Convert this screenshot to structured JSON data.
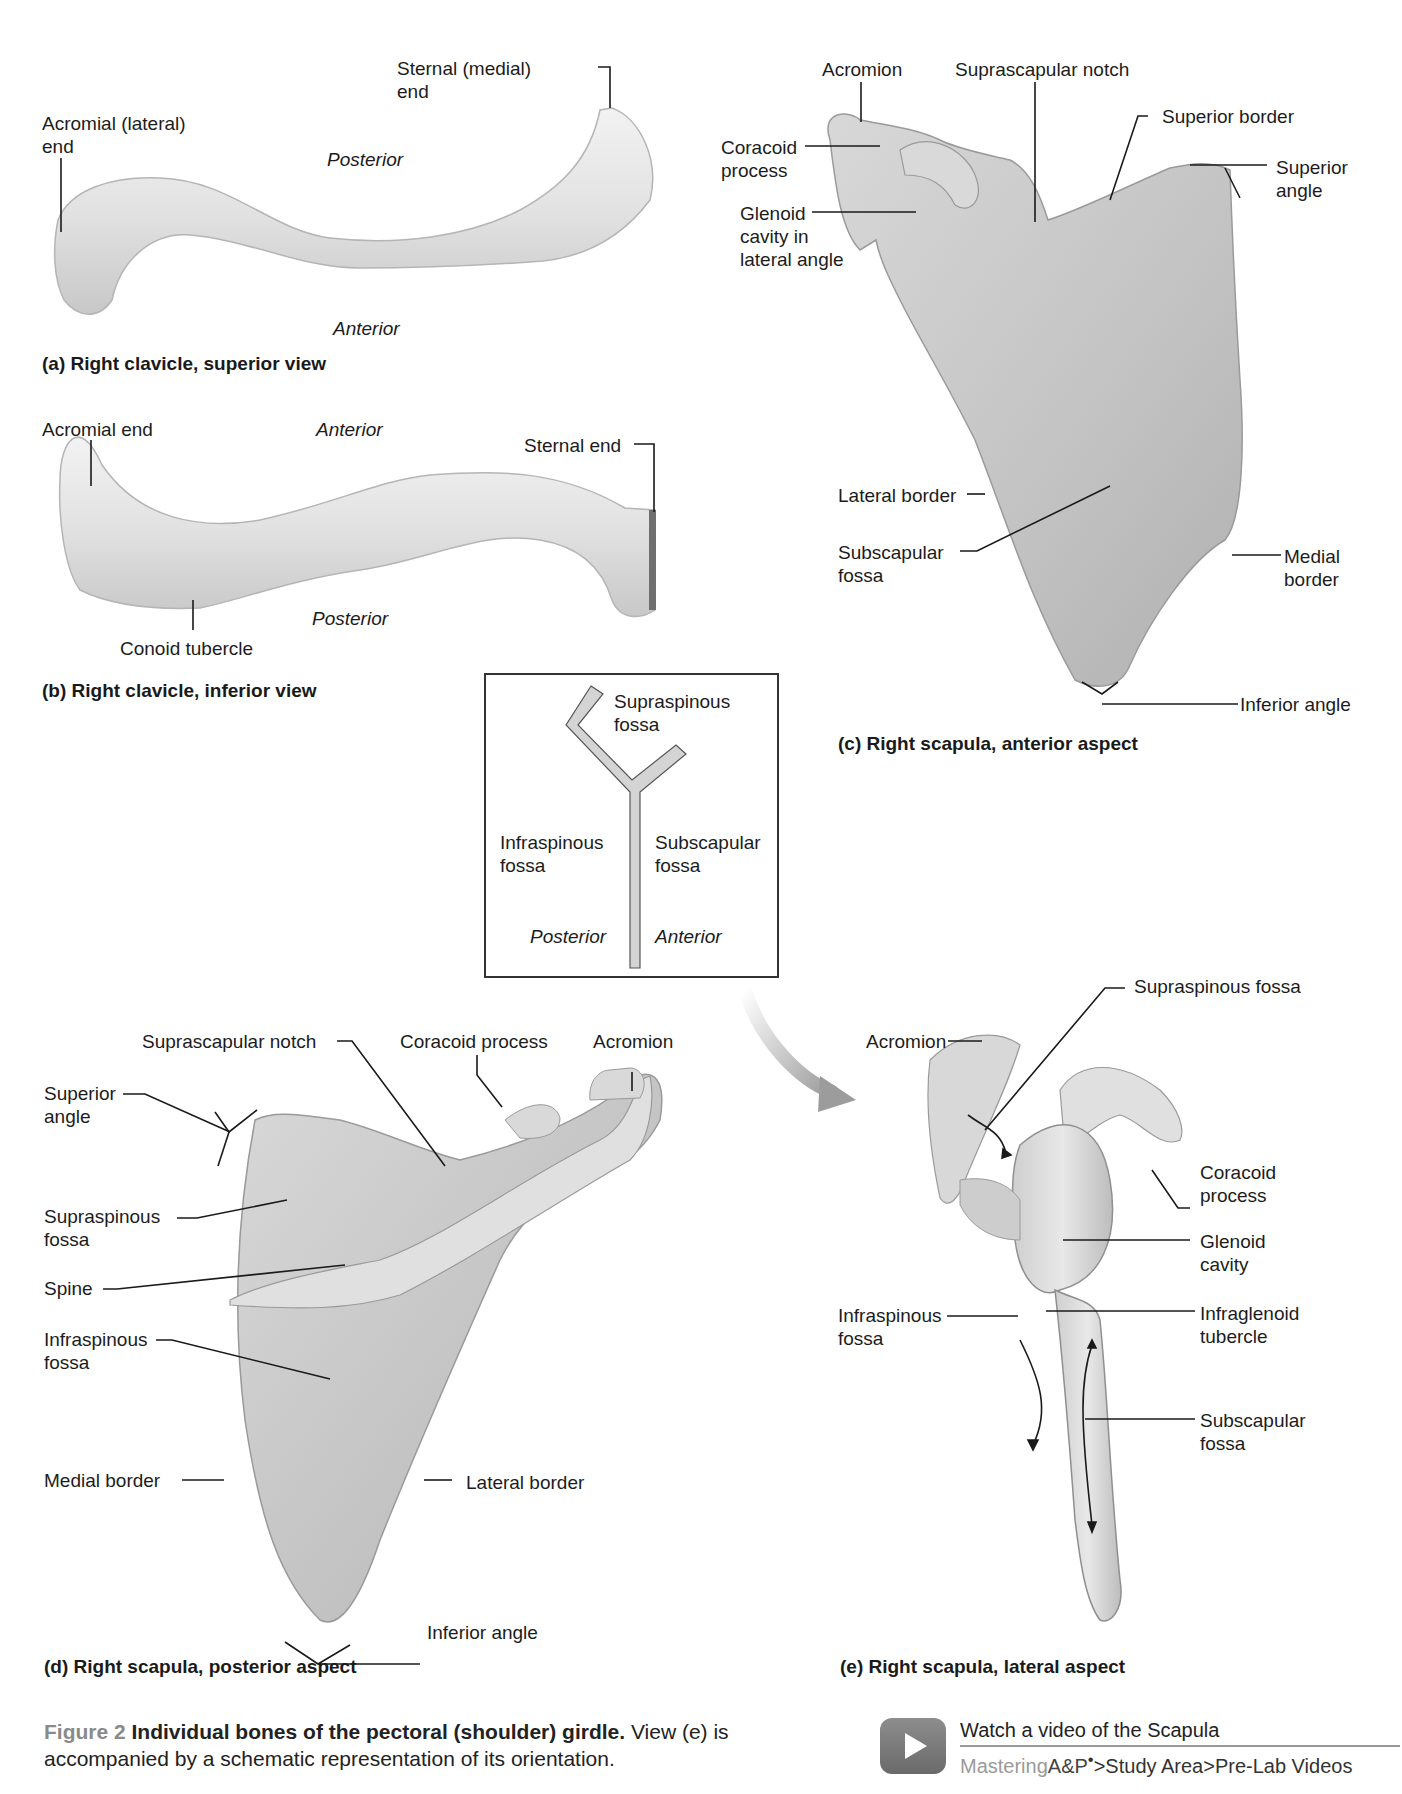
{
  "figure": {
    "number": "Figure 2",
    "title": "Individual bones of the pectoral (shoulder) girdle.",
    "description": " View (e) is accompanied by a schematic representation of its orientation."
  },
  "panels": {
    "a": {
      "caption": "(a) Right clavicle, superior view",
      "labels": {
        "acromial_end": "Acromial (lateral)\nend",
        "sternal_end": "Sternal (medial)\nend",
        "posterior": "Posterior",
        "anterior": "Anterior"
      }
    },
    "b": {
      "caption": "(b) Right clavicle, inferior view",
      "labels": {
        "acromial_end": "Acromial end",
        "anterior": "Anterior",
        "sternal_end": "Sternal end",
        "conoid_tubercle": "Conoid tubercle",
        "posterior": "Posterior"
      }
    },
    "c": {
      "caption": "(c) Right scapula, anterior aspect",
      "labels": {
        "acromion": "Acromion",
        "suprascapular_notch": "Suprascapular notch",
        "superior_border": "Superior border",
        "coracoid_process": "Coracoid\nprocess",
        "superior_angle": "Superior\nangle",
        "glenoid_cavity": "Glenoid\ncavity in\nlateral angle",
        "lateral_border": "Lateral border",
        "subscapular_fossa": "Subscapular\nfossa",
        "medial_border": "Medial\nborder",
        "inferior_angle": "Inferior angle"
      }
    },
    "schematic": {
      "supraspinous": "Supraspinous\nfossa",
      "infraspinous": "Infraspinous\nfossa",
      "subscapular": "Subscapular\nfossa",
      "posterior": "Posterior",
      "anterior": "Anterior"
    },
    "d": {
      "caption": "(d) Right scapula, posterior aspect",
      "labels": {
        "suprascapular_notch": "Suprascapular notch",
        "coracoid_process": "Coracoid process",
        "acromion": "Acromion",
        "superior_angle": "Superior\nangle",
        "supraspinous_fossa": "Supraspinous\nfossa",
        "spine": "Spine",
        "infraspinous_fossa": "Infraspinous\nfossa",
        "medial_border": "Medial border",
        "lateral_border": "Lateral border",
        "inferior_angle": "Inferior angle"
      }
    },
    "e": {
      "caption": "(e) Right scapula, lateral aspect",
      "labels": {
        "supraspinous_fossa": "Supraspinous fossa",
        "acromion": "Acromion",
        "coracoid_process": "Coracoid\nprocess",
        "glenoid_cavity": "Glenoid\ncavity",
        "infraspinous_fossa": "Infraspinous\nfossa",
        "infraglenoid_tubercle": "Infraglenoid\ntubercle",
        "subscapular_fossa": "Subscapular\nfossa"
      }
    }
  },
  "video": {
    "title": "Watch a video of the Scapula",
    "brand_light": "Mastering",
    "brand_dark": "A&P",
    "brand_mark": "•",
    "path": ">Study Area>Pre-Lab Videos",
    "icon": "play-icon"
  },
  "colors": {
    "bone_light": "#ececec",
    "bone_mid": "#cfcfcf",
    "bone_dark": "#a9a9a9",
    "leader_line": "#1a1a1a",
    "schematic_fill": "#d4d4d4",
    "arrow_grey": "#9c9c9c",
    "caption_figure_number": "#8a8a8a"
  }
}
